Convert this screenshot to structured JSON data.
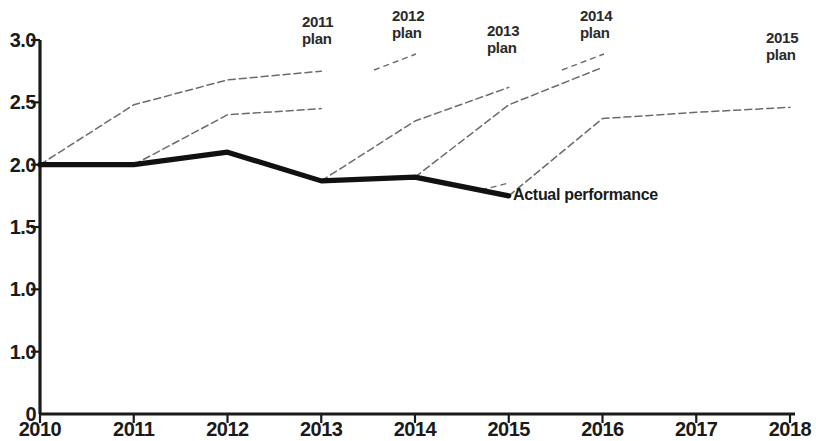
{
  "chart_data": {
    "type": "line",
    "title": "",
    "subtitle": "",
    "xlabel": "",
    "ylabel": "",
    "x": [
      2010,
      2011,
      2012,
      2013,
      2014,
      2015,
      2016,
      2017,
      2018
    ],
    "xlim": [
      2010,
      2018
    ],
    "ylim": [
      0,
      3.0
    ],
    "grid": false,
    "legend_position": "inline-annotations",
    "x_tick_labels": [
      "2010",
      "2011",
      "2012",
      "2013",
      "2014",
      "2015",
      "2016",
      "2017",
      "2018"
    ],
    "y_tick_labels": [
      "0",
      "1.0",
      "1.0",
      "1.5",
      "2.0",
      "2.5",
      "3.0"
    ],
    "y_tick_values": [
      0,
      0.5,
      1.0,
      1.5,
      2.0,
      2.5,
      3.0
    ],
    "y_tick_note": "The 0.5 gridline is printed as '1.0' in the source figure",
    "series": [
      {
        "name": "Actual performance",
        "style": "solid-thick",
        "color": "#111111",
        "x": [
          2010,
          2011,
          2012,
          2013,
          2014,
          2015
        ],
        "values": [
          2.0,
          2.0,
          2.1,
          1.87,
          1.9,
          1.75
        ]
      },
      {
        "name": "2011 plan",
        "style": "dashed-thin",
        "color": "#6b6b6b",
        "x": [
          2010,
          2011,
          2012,
          2013
        ],
        "values": [
          2.0,
          2.48,
          2.68,
          2.75
        ]
      },
      {
        "name": "2012 plan",
        "style": "dashed-thin",
        "color": "#6b6b6b",
        "x": [
          2011,
          2012,
          2013
        ],
        "values": [
          2.0,
          2.4,
          2.45
        ]
      },
      {
        "name": "2013 plan",
        "style": "dashed-thin",
        "color": "#6b6b6b",
        "x": [
          2013,
          2014,
          2015
        ],
        "values": [
          1.87,
          2.35,
          2.62
        ]
      },
      {
        "name": "2014 plan",
        "style": "dashed-thin",
        "color": "#6b6b6b",
        "x": [
          2014,
          2015,
          2016
        ],
        "values": [
          1.9,
          2.48,
          2.78
        ]
      },
      {
        "name": "2015 plan",
        "style": "dashed-thin",
        "color": "#6b6b6b",
        "x": [
          2015,
          2016,
          2017,
          2018
        ],
        "values": [
          1.75,
          2.37,
          2.42,
          2.46
        ]
      }
    ],
    "annotations": [
      {
        "text": "2011\nplan",
        "x": 2013,
        "y": 3.0,
        "label_x_px": 302,
        "label_y_px": 14
      },
      {
        "text": "2012\nplan",
        "x": 2014,
        "y": 3.0,
        "label_x_px": 392,
        "label_y_px": 8
      },
      {
        "text": "2013\nplan",
        "x": 2015,
        "y": 2.95,
        "label_x_px": 487,
        "label_y_px": 23
      },
      {
        "text": "2014\nplan",
        "x": 2016,
        "y": 3.0,
        "label_x_px": 580,
        "label_y_px": 8
      },
      {
        "text": "2015\nplan",
        "x": 2018,
        "y": 2.85,
        "label_x_px": 766,
        "label_y_px": 30
      },
      {
        "text": "Actual performance",
        "x": 2015,
        "y": 1.78,
        "label_x_px": 513,
        "label_y_px": 186
      }
    ],
    "leader_lines": [
      {
        "for": "2012 plan",
        "x1_px": 374,
        "y1_px": 70,
        "x2_px": 416,
        "y2_px": 54
      },
      {
        "for": "2014 plan",
        "x1_px": 562,
        "y1_px": 70,
        "x2_px": 604,
        "y2_px": 54
      },
      {
        "for": "Actual performance",
        "x1_px": 481,
        "y1_px": 190,
        "x2_px": 509,
        "y2_px": 183
      }
    ]
  },
  "axes": {
    "origin_label": "0",
    "y_ticks": [
      {
        "label": "3.0",
        "value": 3.0
      },
      {
        "label": "2.5",
        "value": 2.5
      },
      {
        "label": "2.0",
        "value": 2.0
      },
      {
        "label": "1.5",
        "value": 1.5
      },
      {
        "label": "1.0",
        "value": 1.0
      },
      {
        "label": "1.0",
        "value": 0.5
      },
      {
        "label": "0",
        "value": 0.0
      }
    ],
    "x_ticks": [
      {
        "label": "2010",
        "value": 2010
      },
      {
        "label": "2011",
        "value": 2011
      },
      {
        "label": "2012",
        "value": 2012
      },
      {
        "label": "2013",
        "value": 2013
      },
      {
        "label": "2014",
        "value": 2014
      },
      {
        "label": "2015",
        "value": 2015
      },
      {
        "label": "2016",
        "value": 2016
      },
      {
        "label": "2017",
        "value": 2017
      },
      {
        "label": "2018",
        "value": 2018
      }
    ]
  },
  "colors": {
    "axis": "#1a1a1a",
    "actual_line": "#111111",
    "plan_line": "#6b6b6b",
    "text": "#1a1a1a",
    "background": "#ffffff"
  }
}
